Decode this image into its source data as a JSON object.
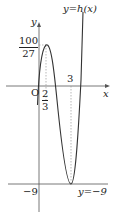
{
  "diagram": {
    "curve_label": "y=h(x)",
    "axis_x_label": "x",
    "axis_y_label": "y",
    "origin_label": "O",
    "local_max": {
      "x_num": "2",
      "x_den": "3",
      "y_num": "100",
      "y_den": "27"
    },
    "local_min": {
      "x": "3",
      "y": "−9"
    },
    "y_min_tick_label": "−9",
    "horizontal_line_label": "y=−9",
    "colors": {
      "curve": "#333333",
      "axis": "#555555",
      "dashed": "#999999"
    }
  }
}
